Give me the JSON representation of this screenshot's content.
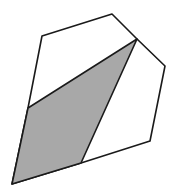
{
  "diagram": {
    "type": "geometry",
    "outline": {
      "stroke": "#1a1a1a",
      "stroke_width": 1.6,
      "fill": "#ffffff",
      "points": [
        [
          42,
          36
        ],
        [
          112,
          14
        ],
        [
          137,
          39
        ],
        [
          165,
          66
        ],
        [
          150,
          141
        ],
        [
          81,
          163
        ],
        [
          12,
          184
        ],
        [
          28,
          108
        ]
      ]
    },
    "shaded_region": {
      "fill": "#a8a8a8",
      "stroke": "#1a1a1a",
      "stroke_width": 1.6,
      "points": [
        [
          28,
          108
        ],
        [
          137,
          39
        ],
        [
          81,
          163
        ],
        [
          12,
          184
        ]
      ]
    }
  }
}
